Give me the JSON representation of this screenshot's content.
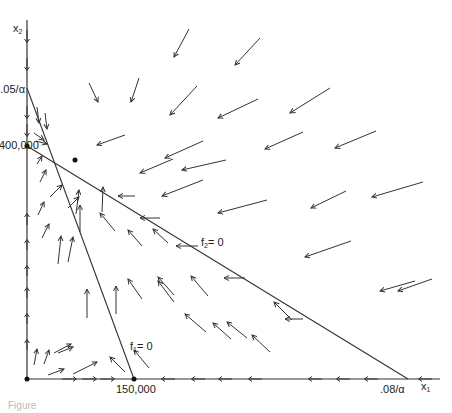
{
  "diagram": {
    "type": "phase-plane",
    "axes": {
      "x_label": "x",
      "x_label_sub": "1",
      "y_label": "x",
      "y_label_sub": "2"
    },
    "tick_labels": {
      "y_top": ".05/α",
      "y_mid": "400,000",
      "x_mid": "150,000",
      "x_right": ".08/α"
    },
    "nullclines": {
      "f1": {
        "label": "f",
        "sub": "1",
        "eq": "= 0"
      },
      "f2": {
        "label": "f",
        "sub": "2",
        "eq": "= 0"
      }
    },
    "equilibria": [
      {
        "name": "origin",
        "x": 27,
        "y": 379
      },
      {
        "name": "x2-intercept",
        "x": 27,
        "y": 146
      },
      {
        "name": "interior",
        "x": 75,
        "y": 160
      },
      {
        "name": "x1-intercept",
        "x": 134,
        "y": 379
      }
    ],
    "stroke_color": "#333333"
  },
  "caption": "Figure"
}
